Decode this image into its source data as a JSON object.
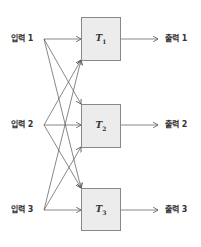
{
  "inputs": [
    {
      "label": "입력 1",
      "y": 39
    },
    {
      "label": "입력 2",
      "y": 125
    },
    {
      "label": "입력 3",
      "y": 210
    }
  ],
  "transforms": [
    {
      "symbol": "T",
      "subscript": "1"
    },
    {
      "symbol": "T",
      "subscript": "2"
    },
    {
      "symbol": "T",
      "subscript": "3"
    }
  ],
  "outputs": [
    {
      "label": "출력 1"
    },
    {
      "label": "출력 2"
    },
    {
      "label": "출력 3"
    }
  ],
  "colors": {
    "line": "#555555",
    "box_fill": "#ececec",
    "box_border": "#888888",
    "text": "#333333"
  }
}
